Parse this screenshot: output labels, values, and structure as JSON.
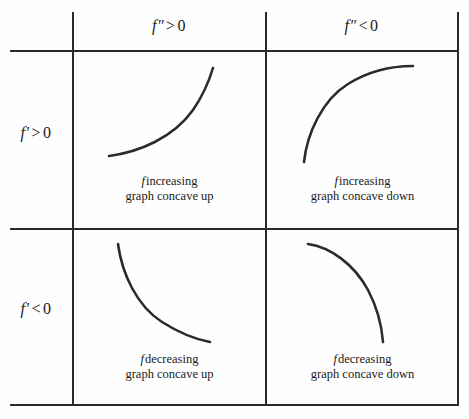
{
  "figure": {
    "type": "reference-table",
    "stroke_color": "#2b2b2b",
    "background_color": "#ffffff"
  },
  "columns": [
    {
      "id": "fpp-positive",
      "func": "f",
      "prime": "″",
      "operator": ">",
      "value": "0"
    },
    {
      "id": "fpp-negative",
      "func": "f",
      "prime": "″",
      "operator": "<",
      "value": "0"
    }
  ],
  "rows": [
    {
      "id": "fp-positive",
      "func": "f",
      "prime": "′",
      "operator": ">",
      "value": "0"
    },
    {
      "id": "fp-negative",
      "func": "f",
      "prime": "′",
      "operator": "<",
      "value": "0"
    }
  ],
  "cells": [
    {
      "id": "increasing-concave-up",
      "func": "f",
      "monotonicity": "increasing",
      "concavity": "graph concave up",
      "curve_path": "M 36 104 C 66 100, 100 86, 120 58 C 131 42, 137 26, 140 16",
      "curve_description": "rising curve, shallow at left and steep at right"
    },
    {
      "id": "increasing-concave-down",
      "func": "f",
      "monotonicity": "increasing",
      "concavity": "graph concave down",
      "curve_path": "M 38 110 C 41 82, 56 48, 82 32 C 106 17, 131 14, 147 14",
      "curve_description": "rising curve, steep at left and flattening at right"
    },
    {
      "id": "decreasing-concave-up",
      "func": "f",
      "monotonicity": "decreasing",
      "concavity": "graph concave up",
      "curve_path": "M 45 14 C 49 44, 64 76, 89 92 C 108 104, 126 110, 137 112",
      "curve_description": "falling curve, steep at left and flattening at right"
    },
    {
      "id": "decreasing-concave-down",
      "func": "f",
      "monotonicity": "decreasing",
      "concavity": "graph concave down",
      "curve_path": "M 42 14 C 64 17, 88 34, 102 60 C 112 79, 116 99, 117 112",
      "curve_description": "falling curve, shallow at left and steep at right"
    }
  ]
}
